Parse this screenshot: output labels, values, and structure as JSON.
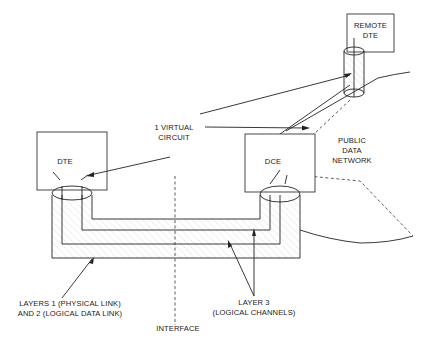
{
  "diagram": {
    "title": "",
    "nodes": {
      "dte": {
        "label": "DTE"
      },
      "dce": {
        "label": "DCE"
      },
      "remote_dte": {
        "label_line1": "REMOTE",
        "label_line2": "DTE"
      }
    },
    "labels": {
      "virtual_circuit_line1": "1 VIRTUAL",
      "virtual_circuit_line2": "CIRCUIT",
      "network_line1": "PUBLIC",
      "network_line2": "DATA",
      "network_line3": "NETWORK",
      "layers12_line1": "LAYERS 1 (PHYSICAL LINK)",
      "layers12_line2": "AND 2 (LOGICAL DATA LINK)",
      "layer3_line1": "LAYER 3",
      "layer3_line2": "(LOGICAL CHANNELS)",
      "interface": "INTERFACE"
    },
    "colors": {
      "line": "#222222",
      "hatch": "#9a9a9a",
      "background": "#ffffff"
    }
  }
}
